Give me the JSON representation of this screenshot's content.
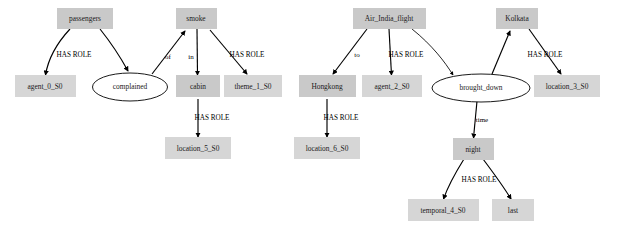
{
  "diagram": {
    "type": "semantic-role-graph",
    "background_color": "#ffffff",
    "node_fill_color": "#c9c9c9",
    "ellipse_fill_color": "#ffffff",
    "edge_color": "#000000"
  },
  "nodes": [
    {
      "id": "passengers",
      "label": "passengers",
      "shape": "box",
      "x": 85,
      "y": 18
    },
    {
      "id": "smoke",
      "label": "smoke",
      "shape": "box",
      "x": 196,
      "y": 18
    },
    {
      "id": "agent_0_S0",
      "label": "agent_0_S0",
      "shape": "box",
      "x": 45,
      "y": 87
    },
    {
      "id": "complained",
      "label": "complained",
      "shape": "ellipse",
      "x": 130,
      "y": 87
    },
    {
      "id": "cabin",
      "label": "cabin",
      "shape": "box",
      "x": 198,
      "y": 87
    },
    {
      "id": "theme_1_S0",
      "label": "theme_1_S0",
      "shape": "box",
      "x": 253,
      "y": 87
    },
    {
      "id": "location_5_S0",
      "label": "location_5_S0",
      "shape": "box",
      "x": 198,
      "y": 148
    },
    {
      "id": "Air_India_flight",
      "label": "Air_India_flight",
      "shape": "box",
      "x": 389,
      "y": 18
    },
    {
      "id": "Kolkata",
      "label": "Kolkata",
      "shape": "box",
      "x": 517,
      "y": 18
    },
    {
      "id": "Hongkong",
      "label": "Hongkong",
      "shape": "box",
      "x": 327,
      "y": 87
    },
    {
      "id": "agent_2_S0",
      "label": "agent_2_S0",
      "shape": "box",
      "x": 392,
      "y": 87
    },
    {
      "id": "brought_down",
      "label": "brought_down",
      "shape": "ellipse",
      "x": 481,
      "y": 87
    },
    {
      "id": "location_3_S0",
      "label": "location_3_S0",
      "shape": "box",
      "x": 567,
      "y": 87
    },
    {
      "id": "location_6_S0",
      "label": "location_6_S0",
      "shape": "box",
      "x": 327,
      "y": 148
    },
    {
      "id": "night",
      "label": "night",
      "shape": "box",
      "x": 473,
      "y": 148
    },
    {
      "id": "temporal_4_S0",
      "label": "temporal_4_S0",
      "shape": "box",
      "x": 443,
      "y": 211
    },
    {
      "id": "last",
      "label": "last",
      "shape": "box",
      "x": 513,
      "y": 211
    }
  ],
  "edges": [
    {
      "from": "passengers",
      "to": "agent_0_S0",
      "label": "HAS ROLE"
    },
    {
      "from": "passengers",
      "to": "complained",
      "label": ""
    },
    {
      "from": "complained",
      "to": "smoke",
      "label": "of"
    },
    {
      "from": "smoke",
      "to": "cabin",
      "label": "in"
    },
    {
      "from": "smoke",
      "to": "theme_1_S0",
      "label": "HAS ROLE"
    },
    {
      "from": "cabin",
      "to": "location_5_S0",
      "label": "HAS ROLE"
    },
    {
      "from": "Air_India_flight",
      "to": "Hongkong",
      "label": "to"
    },
    {
      "from": "Air_India_flight",
      "to": "agent_2_S0",
      "label": "HAS ROLE"
    },
    {
      "from": "Air_India_flight",
      "to": "brought_down",
      "label": ""
    },
    {
      "from": "brought_down",
      "to": "Kolkata",
      "label": ""
    },
    {
      "from": "Kolkata",
      "to": "location_3_S0",
      "label": "HAS ROLE"
    },
    {
      "from": "Hongkong",
      "to": "location_6_S0",
      "label": "HAS ROLE"
    },
    {
      "from": "brought_down",
      "to": "night",
      "label": "time"
    },
    {
      "from": "night",
      "to": "temporal_4_S0",
      "label": "HAS ROLE"
    },
    {
      "from": "night",
      "to": "last",
      "label": ""
    }
  ],
  "edge_labels": {
    "has_role_1": "HAS ROLE",
    "of": "of",
    "in": "in",
    "has_role_2": "HAS ROLE",
    "has_role_3": "HAS ROLE",
    "to": "to",
    "has_role_4": "HAS ROLE",
    "has_role_5": "HAS ROLE",
    "has_role_6": "HAS ROLE",
    "time": "time",
    "has_role_7": "HAS ROLE"
  }
}
